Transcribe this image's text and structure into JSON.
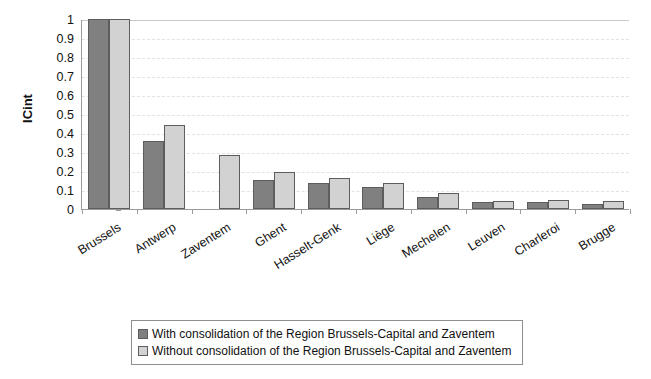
{
  "chart_data": {
    "type": "bar",
    "title": "",
    "xlabel": "",
    "ylabel": "ICint",
    "ylim": [
      0,
      1
    ],
    "yticks": [
      0,
      0.1,
      0.2,
      0.3,
      0.4,
      0.5,
      0.6,
      0.7,
      0.8,
      0.9,
      1
    ],
    "ytick_labels": [
      "0",
      "0.1",
      "0.2",
      "0.3",
      "0.4",
      "0.5",
      "0.6",
      "0.7",
      "0.8",
      "0.9",
      "1"
    ],
    "grid": true,
    "grid_axis": "y",
    "legend_position": "bottom",
    "categories": [
      "Brussels",
      "Antwerp",
      "Zaventem",
      "Ghent",
      "Hasselt-Genk",
      "Liège",
      "Mechelen",
      "Leuven",
      "Charleroi",
      "Brugge"
    ],
    "series": [
      {
        "name": "With consolidation of the Region Brussels-Capital and Zaventem",
        "color": "#808080",
        "values": [
          1.0,
          0.36,
          null,
          0.155,
          0.135,
          0.115,
          0.065,
          0.035,
          0.035,
          0.025
        ]
      },
      {
        "name": "Without consolidation of the Region Brussels-Capital and Zaventem",
        "color": "#d2d2d2",
        "values": [
          1.0,
          0.44,
          0.285,
          0.195,
          0.165,
          0.135,
          0.085,
          0.04,
          0.045,
          0.04
        ]
      }
    ]
  },
  "legend": {
    "entries": [
      {
        "label": "With consolidation of the Region Brussels-Capital and Zaventem",
        "swatch": "dark"
      },
      {
        "label": "Without consolidation of the Region Brussels-Capital and Zaventem",
        "swatch": "light"
      }
    ]
  },
  "colors": {
    "series_dark": "#808080",
    "series_light": "#d2d2d2",
    "bar_border": "#5d5d5d",
    "axis": "#9a9a9a",
    "gridline": "#e2e2e2",
    "background": "#ffffff"
  }
}
